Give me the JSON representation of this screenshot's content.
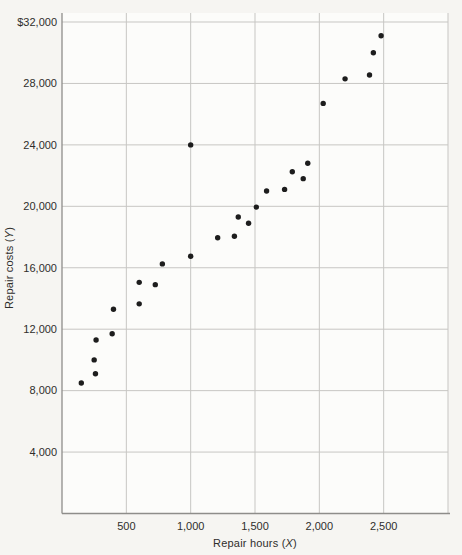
{
  "figure": {
    "background": "#f6f5f2",
    "plot_background": "#fcfcfa",
    "grid_color": "#c7c6c3",
    "axis_color": "#8e8d8a",
    "text_color": "#2f2e2c",
    "dot_color": "#1d1d1d"
  },
  "axes": {
    "y": {
      "title_prefix": "Repair costs (",
      "title_var": "Y",
      "title_suffix": ")",
      "ticks": [
        {
          "label": "$32,000",
          "value": 32000
        },
        {
          "label": "28,000",
          "value": 28000
        },
        {
          "label": "24,000",
          "value": 24000
        },
        {
          "label": "20,000",
          "value": 20000
        },
        {
          "label": "16,000",
          "value": 16000
        },
        {
          "label": "12,000",
          "value": 12000
        },
        {
          "label": "8,000",
          "value": 8000
        },
        {
          "label": "4,000",
          "value": 4000
        }
      ]
    },
    "x": {
      "title_prefix": "Repair hours (",
      "title_var": "X",
      "title_suffix": ")",
      "ticks": [
        {
          "label": "500",
          "value": 500
        },
        {
          "label": "1,000",
          "value": 1000
        },
        {
          "label": "1,500",
          "value": 1500
        },
        {
          "label": "2,000",
          "value": 2000
        },
        {
          "label": "2,500",
          "value": 2500
        }
      ]
    }
  },
  "chart_data": {
    "type": "scatter",
    "title": "",
    "xlabel": "Repair hours (X)",
    "ylabel": "Repair costs (Y)",
    "xlim": [
      0,
      3000
    ],
    "ylim": [
      0,
      32000
    ],
    "grid": true,
    "legend": false,
    "x_gridlines": [
      500,
      1000,
      1500,
      2000,
      2500,
      3000
    ],
    "y_gridlines": [
      4000,
      8000,
      12000,
      16000,
      20000,
      24000,
      28000,
      32000
    ],
    "points": [
      [
        150,
        8500
      ],
      [
        250,
        10000
      ],
      [
        260,
        9100
      ],
      [
        265,
        11300
      ],
      [
        390,
        11700
      ],
      [
        400,
        13300
      ],
      [
        600,
        13650
      ],
      [
        600,
        15050
      ],
      [
        725,
        14900
      ],
      [
        780,
        16250
      ],
      [
        1000,
        16750
      ],
      [
        1000,
        24000
      ],
      [
        1210,
        17950
      ],
      [
        1340,
        18050
      ],
      [
        1370,
        19300
      ],
      [
        1450,
        18900
      ],
      [
        1510,
        19950
      ],
      [
        1590,
        21000
      ],
      [
        1730,
        21100
      ],
      [
        1790,
        22250
      ],
      [
        1875,
        21800
      ],
      [
        1910,
        22800
      ],
      [
        2030,
        26700
      ],
      [
        2200,
        28300
      ],
      [
        2390,
        28550
      ],
      [
        2420,
        30000
      ],
      [
        2480,
        31100
      ]
    ]
  }
}
